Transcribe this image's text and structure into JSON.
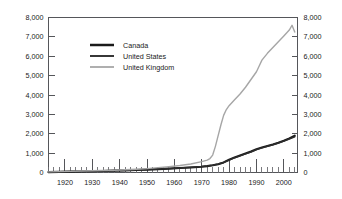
{
  "chart_data": {
    "type": "line",
    "title": "",
    "subtitle": "",
    "xlabel": "",
    "ylabel": "",
    "xlim": [
      1914,
      2005
    ],
    "ylim": [
      0,
      8000
    ],
    "grid": false,
    "legend_position": "upper-left-inside",
    "y_axis_left": {
      "ticks": [
        0,
        1000,
        2000,
        3000,
        4000,
        5000,
        6000,
        7000,
        8000
      ],
      "tick_labels": [
        "0",
        "1,000",
        "2,000",
        "3,000",
        "4,000",
        "5,000",
        "6,000",
        "7,000",
        "8,000"
      ]
    },
    "y_axis_right": {
      "ticks": [
        0,
        1000,
        2000,
        3000,
        4000,
        5000,
        6000,
        7000,
        8000
      ],
      "tick_labels": [
        "0",
        "1,000",
        "2,000",
        "3,000",
        "4,000",
        "5,000",
        "6,000",
        "7,000",
        "8,000"
      ]
    },
    "x_axis": {
      "ticks": [
        1920,
        1930,
        1940,
        1950,
        1960,
        1970,
        1980,
        1990,
        2000
      ],
      "tick_labels": [
        "1920",
        "1930",
        "1940",
        "1950",
        "1960",
        "1970",
        "1980",
        "1990",
        "2000"
      ],
      "minor_tick_interval": 2
    },
    "series": [
      {
        "name": "Canada",
        "color": "#1a1a1a",
        "stroke_width": 2.1,
        "x": [
          1914,
          1918,
          1922,
          1926,
          1930,
          1934,
          1938,
          1942,
          1946,
          1950,
          1954,
          1958,
          1962,
          1966,
          1970,
          1972,
          1974,
          1976,
          1978,
          1980,
          1982,
          1984,
          1986,
          1988,
          1990,
          1992,
          1994,
          1996,
          1998,
          2000,
          2002,
          2004
        ],
        "values": [
          20,
          30,
          45,
          55,
          70,
          80,
          95,
          110,
          130,
          150,
          175,
          200,
          230,
          260,
          300,
          330,
          370,
          430,
          520,
          660,
          780,
          880,
          980,
          1080,
          1200,
          1290,
          1370,
          1450,
          1540,
          1640,
          1760,
          1900
        ]
      },
      {
        "name": "United States",
        "color": "#2d2d2d",
        "stroke_width": 1.5,
        "x": [
          1914,
          1918,
          1922,
          1926,
          1930,
          1934,
          1938,
          1942,
          1946,
          1950,
          1954,
          1958,
          1962,
          1966,
          1970,
          1972,
          1974,
          1976,
          1978,
          1980,
          1982,
          1984,
          1986,
          1988,
          1990,
          1992,
          1994,
          1996,
          1998,
          2000,
          2002,
          2004
        ],
        "values": [
          25,
          35,
          50,
          60,
          75,
          85,
          100,
          115,
          135,
          155,
          180,
          205,
          235,
          265,
          305,
          335,
          375,
          435,
          515,
          640,
          760,
          860,
          960,
          1060,
          1180,
          1270,
          1350,
          1430,
          1520,
          1620,
          1730,
          1840
        ]
      },
      {
        "name": "United Kingdom",
        "color": "#a6a6a6",
        "stroke_width": 1.4,
        "x": [
          1914,
          1918,
          1922,
          1926,
          1930,
          1934,
          1938,
          1942,
          1946,
          1950,
          1954,
          1958,
          1962,
          1966,
          1970,
          1972,
          1973,
          1974,
          1975,
          1976,
          1977,
          1978,
          1979,
          1980,
          1982,
          1984,
          1986,
          1988,
          1990,
          1991,
          1992,
          1994,
          1996,
          1998,
          2000,
          2002,
          2003,
          2004
        ],
        "values": [
          30,
          45,
          60,
          75,
          90,
          105,
          120,
          140,
          165,
          200,
          250,
          300,
          360,
          440,
          560,
          640,
          720,
          900,
          1350,
          1900,
          2450,
          2950,
          3250,
          3450,
          3750,
          4050,
          4400,
          4800,
          5200,
          5500,
          5800,
          6150,
          6450,
          6750,
          7050,
          7350,
          7600,
          7250
        ]
      }
    ]
  },
  "legend": {
    "entries": [
      {
        "label": "Canada"
      },
      {
        "label": "United States"
      },
      {
        "label": "United Kingdom"
      }
    ]
  }
}
